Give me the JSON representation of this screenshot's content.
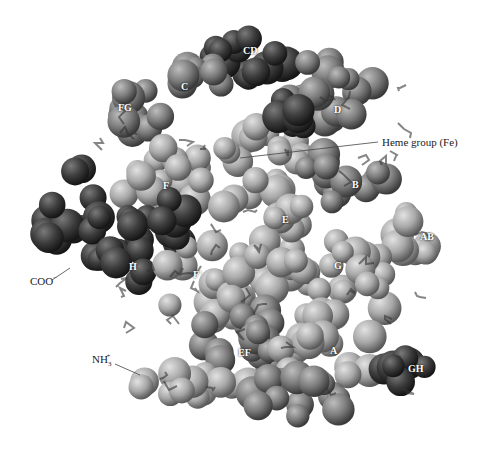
{
  "figure": {
    "colors": {
      "background": "#ffffff",
      "sphere_light": "#b8b8b8",
      "sphere_mid": "#7a7a7a",
      "sphere_dark": "#2e2e2e",
      "label_text": "#ffffff",
      "callout_text": "#222222"
    },
    "helix_labels": [
      {
        "id": "CD",
        "text": "CD",
        "x": 243,
        "y": 52
      },
      {
        "id": "C",
        "text": "C",
        "x": 181,
        "y": 88
      },
      {
        "id": "FG",
        "text": "FG",
        "x": 118,
        "y": 109
      },
      {
        "id": "D",
        "text": "D",
        "x": 334,
        "y": 111
      },
      {
        "id": "F",
        "text": "F",
        "x": 163,
        "y": 187
      },
      {
        "id": "B",
        "text": "B",
        "x": 352,
        "y": 186
      },
      {
        "id": "E",
        "text": "E",
        "x": 282,
        "y": 221
      },
      {
        "id": "AB",
        "text": "AB",
        "x": 420,
        "y": 238
      },
      {
        "id": "G",
        "text": "G",
        "x": 334,
        "y": 267
      },
      {
        "id": "H",
        "text": "H",
        "x": 129,
        "y": 268
      },
      {
        "id": "F-prime",
        "text": "F'",
        "x": 193,
        "y": 276
      },
      {
        "id": "EF",
        "text": "EF",
        "x": 238,
        "y": 354
      },
      {
        "id": "A",
        "text": "A",
        "x": 330,
        "y": 352
      },
      {
        "id": "GH",
        "text": "GH",
        "x": 408,
        "y": 370
      }
    ],
    "callouts": [
      {
        "id": "heme",
        "text": "Heme group (Fe)",
        "x": 382,
        "y": 144
      },
      {
        "id": "coo",
        "text": "COO",
        "sup": "−",
        "x": 30,
        "y": 280
      },
      {
        "id": "nh3",
        "text": "NH",
        "sub": "3",
        "sup": "+",
        "x": 92,
        "y": 359
      }
    ]
  }
}
